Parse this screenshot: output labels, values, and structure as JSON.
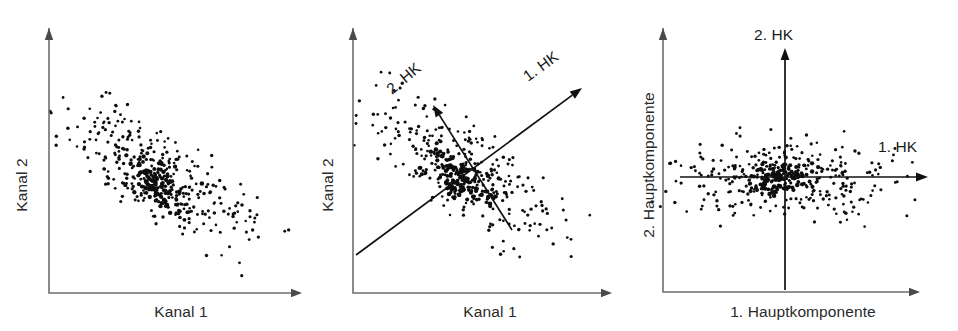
{
  "figure": {
    "background_color": "#ffffff",
    "dot_color": "#0d0d0d",
    "axis_color": "#6f6f6f",
    "pc_axis_color": "#111111",
    "label_color": "#2a2a2a",
    "width": 958,
    "height": 331
  },
  "panels": [
    {
      "id": "panel-1",
      "name": "original-channel-space",
      "xlabel": "Kanal 1",
      "ylabel": "Kanal 2",
      "pc_labels": []
    },
    {
      "id": "panel-2",
      "name": "channel-space-with-principal-axes",
      "xlabel": "Kanal 1",
      "ylabel": "Kanal 2",
      "pc_labels": [
        "1. HK",
        "2. HK"
      ]
    },
    {
      "id": "panel-3",
      "name": "principal-component-space",
      "xlabel": "1. Hauptkomponente",
      "ylabel": "2. Hauptkomponente",
      "pc_labels": [
        "1. HK",
        "2. HK"
      ]
    }
  ],
  "chart_data": {
    "type": "scatter",
    "grid": false,
    "legend": false,
    "n_points": 430,
    "charts": [
      {
        "panel": "panel-1",
        "xlabel": "Kanal 1",
        "ylabel": "Kanal 2",
        "correlation": 0.85,
        "cloud": {
          "center_x": 163,
          "center_y": 178,
          "major_sigma": 62,
          "minor_sigma": 21,
          "angle_deg": -36,
          "core_offset_x": -8,
          "core_offset_y": 6,
          "core_sigma": 11,
          "core_fraction": 0.34
        },
        "axes": {
          "x_from": [
            49,
            293
          ],
          "x_to": [
            302,
            293
          ],
          "y_from": [
            49,
            293
          ],
          "y_to": [
            49,
            28
          ],
          "arrowheads": [
            "x-right",
            "y-up"
          ]
        },
        "pc_axes": []
      },
      {
        "panel": "panel-2",
        "xlabel": "Kanal 1",
        "ylabel": "Kanal 2",
        "correlation": 0.85,
        "cloud": {
          "center_x": 148,
          "center_y": 172,
          "major_sigma": 62,
          "minor_sigma": 21,
          "angle_deg": -36,
          "core_offset_x": -8,
          "core_offset_y": 6,
          "core_sigma": 11,
          "core_fraction": 0.34
        },
        "axes": {
          "x_from": [
            33,
            293
          ],
          "x_to": [
            292,
            293
          ],
          "y_from": [
            33,
            293
          ],
          "y_to": [
            33,
            28
          ],
          "arrowheads": [
            "x-right",
            "y-up"
          ]
        },
        "pc_axes": [
          {
            "label": "1. HK",
            "from": [
              36,
              255
            ],
            "to": [
              262,
              88
            ],
            "angle_deg": -36,
            "label_pos": [
              208,
              82
            ],
            "label_rotate_deg": -36
          },
          {
            "label": "2. HK",
            "from": [
              192,
              230
            ],
            "to": [
              113,
              105
            ],
            "angle_deg": -58,
            "label_pos": [
              72,
              95
            ],
            "label_rotate_deg": -40
          }
        ]
      },
      {
        "panel": "panel-3",
        "xlabel": "1. Hauptkomponente",
        "ylabel": "2. Hauptkomponente",
        "correlation": 0.0,
        "cloud": {
          "center_x": 147,
          "center_y": 177,
          "major_sigma": 64,
          "minor_sigma": 22,
          "angle_deg": 0,
          "core_offset_x": -6,
          "core_offset_y": 0,
          "core_sigma": 11,
          "core_fraction": 0.34
        },
        "axes": {
          "x_from": [
            25,
            292
          ],
          "x_to": [
            282,
            292
          ],
          "y_from": [
            25,
            292
          ],
          "y_to": [
            25,
            28
          ],
          "arrowheads": [
            "x-right",
            "y-up"
          ]
        },
        "pc_axes": [
          {
            "label": "1. HK",
            "from": [
              42,
              177
            ],
            "to": [
              290,
              177
            ],
            "angle_deg": 0,
            "label_pos": [
              240,
              152
            ],
            "label_rotate_deg": 0
          },
          {
            "label": "2. HK",
            "from": [
              147,
              290
            ],
            "to": [
              147,
              48
            ],
            "angle_deg": -90,
            "label_pos": [
              116,
              40
            ],
            "label_rotate_deg": 0
          }
        ]
      }
    ]
  },
  "labels": {
    "kanal_1": "Kanal 1",
    "kanal_2": "Kanal 2",
    "hk_1_short": "1. HK",
    "hk_2_short": "2. HK",
    "hk_1_long": "1. Hauptkomponente",
    "hk_2_long": "2. Hauptkomponente"
  }
}
